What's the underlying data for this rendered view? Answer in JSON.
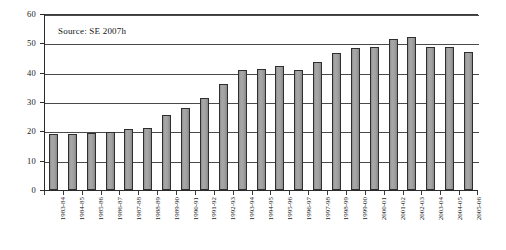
{
  "chart_data": {
    "type": "bar",
    "title": "",
    "subtitle": "",
    "xlabel": "",
    "ylabel": "",
    "ylim": [
      0,
      60
    ],
    "yticks": [
      0,
      10,
      20,
      30,
      40,
      50,
      60
    ],
    "grid": true,
    "legend": null,
    "annotations": [
      {
        "name": "source-note",
        "text": "Source: SE 2007h"
      }
    ],
    "categories": [
      "1983-84",
      "1984-85",
      "1985-86",
      "1986-87",
      "1987-88",
      "1988-89",
      "1989-90",
      "1990-91",
      "1991-92",
      "1992-93",
      "1993-94",
      "1994-95",
      "1995-96",
      "1996-97",
      "1997-98",
      "1998-99",
      "1999-00",
      "2000-01",
      "2001-02",
      "2002-03",
      "2003-04",
      "2004-05",
      "2005-06"
    ],
    "values": [
      19.0,
      19.2,
      19.4,
      19.8,
      20.8,
      21.0,
      25.6,
      27.8,
      31.5,
      36.0,
      40.8,
      41.2,
      42.2,
      41.0,
      43.8,
      46.6,
      48.4,
      48.8,
      51.5,
      52.0,
      48.6,
      48.8,
      47.2
    ]
  },
  "colors": {
    "bar_fill": "#9d9d9d",
    "bar_border": "#2e2e2e",
    "gridline": "#4a4a4a",
    "axis": "#2b2b2b",
    "text": "#1a1a1a",
    "background": "#ffffff"
  }
}
